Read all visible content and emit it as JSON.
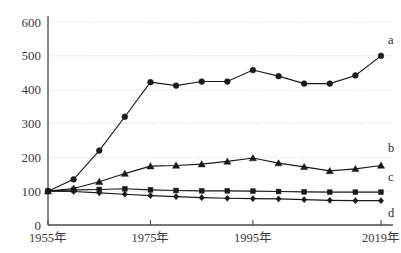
{
  "chart_data": {
    "type": "line",
    "title": "",
    "subtitle": "",
    "xlabel": "",
    "ylabel": "",
    "ylim": [
      0,
      600
    ],
    "ytick_values": [
      0,
      100,
      200,
      300,
      400,
      500,
      600
    ],
    "ytick_labels": [
      "0",
      "100",
      "200",
      "300",
      "400",
      "500",
      "600"
    ],
    "grid": true,
    "grid_style": "dotted-horizontal",
    "legend_position": "right-inline-end-of-line",
    "x": [
      1955,
      1960,
      1965,
      1970,
      1975,
      1980,
      1985,
      1990,
      1995,
      2000,
      2005,
      2010,
      2015,
      2019
    ],
    "xtick_positions": [
      1955,
      1975,
      1995,
      2019
    ],
    "xtick_labels": [
      "1955年",
      "1975年",
      "1995年",
      "2019年"
    ],
    "series": [
      {
        "name": "a",
        "label": "a",
        "marker": "circle",
        "color": "#1a1a1a",
        "values": [
          100,
          135,
          220,
          320,
          422,
          412,
          424,
          424,
          458,
          440,
          418,
          418,
          442,
          500
        ]
      },
      {
        "name": "b",
        "label": "b",
        "marker": "triangle",
        "color": "#1a1a1a",
        "values": [
          100,
          108,
          128,
          152,
          174,
          176,
          180,
          188,
          198,
          183,
          172,
          160,
          166,
          176
        ]
      },
      {
        "name": "c",
        "label": "c",
        "marker": "square",
        "color": "#1a1a1a",
        "values": [
          100,
          104,
          105,
          107,
          104,
          102,
          101,
          101,
          100,
          99,
          98,
          97,
          97,
          97
        ]
      },
      {
        "name": "d",
        "label": "d",
        "marker": "diamond",
        "color": "#1a1a1a",
        "values": [
          100,
          99,
          95,
          91,
          87,
          84,
          81,
          79,
          78,
          77,
          75,
          73,
          72,
          72
        ]
      }
    ]
  },
  "axis": {
    "y_labels": [
      "600",
      "500",
      "400",
      "300",
      "200",
      "100",
      "0"
    ],
    "x_labels": [
      "1955年",
      "1975年",
      "1995年",
      "2019年"
    ]
  },
  "legend": {
    "entries": [
      "a",
      "b",
      "c",
      "d"
    ]
  }
}
